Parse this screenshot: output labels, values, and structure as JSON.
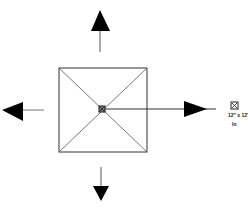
{
  "diagram": {
    "drain_label": "12\" x 12\"",
    "drain_sublabel": "In",
    "colors": {
      "line": "#333333",
      "arrow": "#000000",
      "background": "#ffffff"
    },
    "arrows": [
      "up",
      "down",
      "left",
      "right"
    ]
  }
}
